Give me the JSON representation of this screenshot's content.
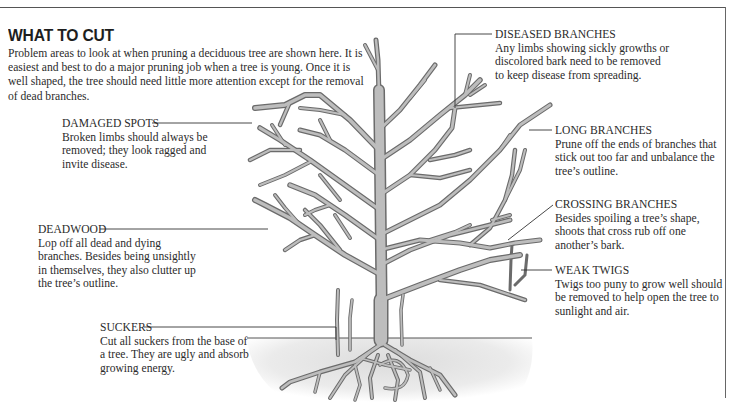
{
  "title": "WHAT TO CUT",
  "intro": "Problem areas to look at when pruning a deciduous tree are shown here. It is easiest and best to do a major pruning job when a tree is young. Once it is well shaped, the tree should need little more attention except for the removal of dead branches.",
  "labels": {
    "diseased_branches": {
      "heading": "DISEASED BRANCHES",
      "text": "Any limbs showing sickly growths or discolored bark need to be removed to keep disease from spreading."
    },
    "damaged_spots": {
      "heading": "DAMAGED SPOTS",
      "text": "Broken limbs should always be removed; they look ragged and invite disease."
    },
    "long_branches": {
      "heading": "LONG BRANCHES",
      "text": "Prune off the ends of branches that stick out too far and unbalance the tree’s outline."
    },
    "crossing_branches": {
      "heading": "CROSSING BRANCHES",
      "text": "Besides spoiling a tree’s shape, shoots that cross rub off one another’s bark."
    },
    "deadwood": {
      "heading": "DEADWOOD",
      "text": "Lop off all dead and dying branches. Besides being unsightly in themselves, they also clutter up the tree’s outline."
    },
    "weak_twigs": {
      "heading": "WEAK TWIGS",
      "text": "Twigs too puny to grow well should be removed to help open the tree to sunlight and air."
    },
    "suckers": {
      "heading": "SUCKERS",
      "text": "Cut all suckers from the base of a tree. They are ugly and absorb growing energy."
    }
  },
  "colors": {
    "branch_outline": "#6b6b6b",
    "branch_fill": "#b9b9b9",
    "ground": "#e6e6e6",
    "leader_line": "#333333",
    "text": "#2b2b2b"
  }
}
